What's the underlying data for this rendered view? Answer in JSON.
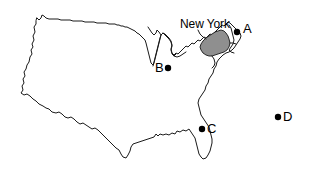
{
  "figure": {
    "name": "united-states-map",
    "width": 311,
    "height": 171,
    "background_color": "#ffffff"
  },
  "map": {
    "outline_color": "#1a1a1a",
    "land_fill": "#ffffff",
    "highlight_fill": "#8f8f8f",
    "highlight_state": "New York"
  },
  "labels": {
    "state": {
      "text": "New York",
      "x": 180,
      "y": 18,
      "color": "#000000"
    }
  },
  "points": [
    {
      "id": "A",
      "label": "A",
      "dot_x": 237,
      "dot_y": 32,
      "label_x": 243,
      "label_y": 22,
      "label_side": "right",
      "color": "#000000",
      "radius": 3.2
    },
    {
      "id": "B",
      "label": "B",
      "dot_x": 168,
      "dot_y": 68,
      "label_x": 155,
      "label_y": 61,
      "label_side": "left",
      "color": "#000000",
      "radius": 3.2
    },
    {
      "id": "C",
      "label": "C",
      "dot_x": 202,
      "dot_y": 129,
      "label_x": 207,
      "label_y": 122,
      "label_side": "right",
      "color": "#000000",
      "radius": 3.2
    },
    {
      "id": "D",
      "label": "D",
      "dot_x": 278,
      "dot_y": 117,
      "label_x": 283,
      "label_y": 110,
      "label_side": "right",
      "color": "#000000",
      "radius": 3.2
    }
  ]
}
